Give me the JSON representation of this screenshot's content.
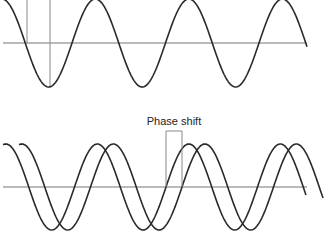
{
  "figure": {
    "panels": [
      {
        "id": "top",
        "description": "Single sine wave with reference lines",
        "axis_y": 43,
        "amplitude": 44,
        "period": 93.5,
        "waves": [
          {
            "name": "wave",
            "zero_cross_rising_x": 165.5,
            "x_start": 0,
            "x_end": 307
          }
        ],
        "reference_lines": [
          {
            "x": 27,
            "y1": 0,
            "y2": 43
          },
          {
            "x": 50,
            "y1": 0,
            "y2": 88
          }
        ]
      },
      {
        "id": "bottom",
        "description": "Two identical sine waves offset by a phase shift",
        "axis_y": 187,
        "amplitude": 43,
        "period": 91.5,
        "waves": [
          {
            "name": "wave-a",
            "zero_cross_rising_x": 166,
            "x_start": 3,
            "x_end": 306
          },
          {
            "name": "wave-b",
            "zero_cross_rising_x": 182,
            "x_start": 19,
            "x_end": 323
          }
        ],
        "phase_shift": {
          "label": "Phase shift",
          "x1": 166,
          "x2": 182,
          "top_y": 131
        }
      }
    ],
    "colors": {
      "wave": "#2a2a2a",
      "axis": "#777777",
      "ref": "#888888"
    }
  }
}
